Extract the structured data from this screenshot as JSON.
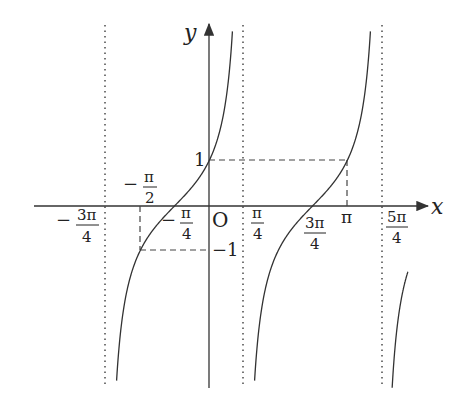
{
  "figure": {
    "function": "y = tan(x + π/4)",
    "axes": {
      "x_label": "x",
      "y_label": "y",
      "origin_label": "O"
    },
    "x_ticks": [
      {
        "label_num": "3π",
        "label_den": "4",
        "sign": "−",
        "value": "-3π/4",
        "role": "asymptote"
      },
      {
        "label_num": "π",
        "label_den": "2",
        "sign": "−",
        "value": "-π/2",
        "role": "dashed guide"
      },
      {
        "label_num": "π",
        "label_den": "4",
        "sign": "−",
        "value": "-π/4",
        "role": "zero"
      },
      {
        "label_num": "π",
        "label_den": "4",
        "sign": "",
        "value": "π/4",
        "role": "asymptote"
      },
      {
        "label_num": "3π",
        "label_den": "4",
        "sign": "",
        "value": "3π/4",
        "role": "zero"
      },
      {
        "label_text": "π",
        "value": "π",
        "role": "dashed guide"
      },
      {
        "label_num": "5π",
        "label_den": "4",
        "sign": "",
        "value": "5π/4",
        "role": "asymptote"
      }
    ],
    "y_ticks": [
      {
        "label": "1",
        "value": 1
      },
      {
        "label": "−1",
        "value": -1
      }
    ],
    "colors": {
      "curve": "#333333",
      "axis": "#333333",
      "guide": "#444444",
      "asymptote": "#555555"
    }
  }
}
